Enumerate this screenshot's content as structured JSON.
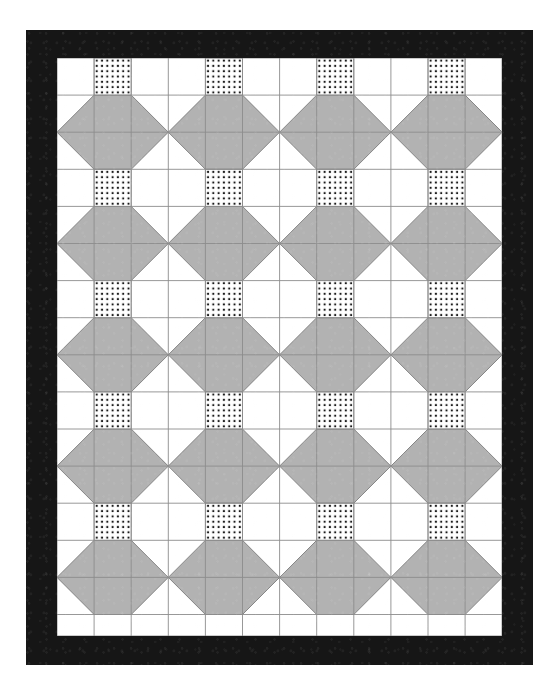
{
  "artwork": {
    "title": "Quilt Pattern",
    "kind": "quilt-block-layout",
    "canvas": {
      "width": 558,
      "height": 698,
      "background": "#ffffff"
    }
  },
  "border": {
    "name": "outer-black-border",
    "color": "#161616",
    "x": 26,
    "y": 30,
    "width": 507,
    "height": 635,
    "thickness": 28,
    "texture": "mottled-dark-fabric"
  },
  "field": {
    "name": "pieced-quilt-field",
    "x": 31,
    "y": 28,
    "width": 445,
    "height": 578,
    "background": "#ffffff"
  },
  "grid": {
    "cell_width": 37.1,
    "cell_height": 37.1,
    "columns": 12,
    "rows": 16,
    "line_color": "#8c8c8c",
    "line_width": 0.9,
    "visible": true
  },
  "colors": {
    "background": "#ffffff",
    "gray_patch": "#b2b2b2",
    "gray_patch_edge": "#7d7d7d",
    "dot": "#1a1a1a",
    "dotted_patch_background": "#ffffff",
    "grid_line": "#8c8c8c",
    "border_black": "#161616"
  },
  "motif": {
    "name": "square-in-a-square-with-flying-geese",
    "block_columns": 3,
    "block_rows": 3,
    "repeat_x": 3,
    "repeat_y": 3,
    "description": "Gray elongated octagon/diamond unit spanning three columns and two rows, centered under a dotted square."
  },
  "dotted_patch": {
    "name": "dotted-square-patch",
    "dots_per_row": 7,
    "dots_per_column": 7,
    "dot_size": 2.0,
    "dot_spacing": 5.3,
    "dot_color": "#1a1a1a",
    "count_visible": 20,
    "columns_occupied": [
      1,
      4,
      7,
      10
    ],
    "rows_occupied": [
      0,
      3,
      6,
      9,
      12
    ]
  },
  "gray_units": {
    "name": "gray-diamond-unit",
    "fill": "#b2b2b2",
    "stroke": "#7d7d7d",
    "center_columns": [
      1,
      4,
      7,
      10
    ],
    "center_rows": [
      2,
      5,
      8,
      11,
      14
    ],
    "half_units_at_edges": true,
    "count_full": 15,
    "count_edge_halves": 10
  },
  "labels": {
    "title": "Quilt Pattern",
    "alt": "Geometric quilt with gray diamonds, dotted squares and a wide black border"
  }
}
